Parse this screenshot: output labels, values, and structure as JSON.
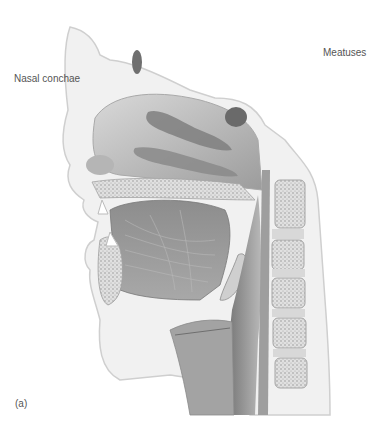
{
  "figure": {
    "panel_label": "(a)",
    "labels": {
      "nasal_conchae": "Nasal conchae",
      "meatuses": "Meatuses"
    },
    "palette": {
      "background": "#ffffff",
      "skin_outline": "#cfcfcf",
      "tissue_light": "#e6e6e6",
      "tissue_mid": "#bdbdbd",
      "tissue_dark": "#8a8a8a",
      "cavity_shadow": "#6f6f6f",
      "bone_speckle": "#9a9a9a",
      "label_text": "#555555"
    }
  }
}
